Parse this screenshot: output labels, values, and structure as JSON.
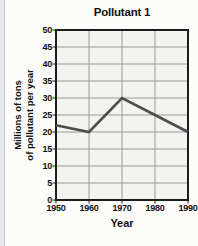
{
  "page": {
    "background": "#fcfcfa",
    "left_strip_color": "#e4e7ee",
    "left_strip_border": "#c6cad6"
  },
  "chart_data": {
    "type": "line",
    "title": "Pollutant 1",
    "xlabel": "Year",
    "ylabel": "Millions of tons of pollutant per year",
    "ylabel_lines": [
      "Millions of tons",
      "of pollutant per year"
    ],
    "categories": [
      "1950",
      "1960",
      "1970",
      "1980",
      "1990"
    ],
    "values": [
      22,
      20,
      30,
      25,
      20
    ],
    "ylim": [
      0,
      50
    ],
    "yticks": [
      0,
      5,
      10,
      15,
      20,
      25,
      30,
      35,
      40,
      45,
      50
    ],
    "grid": true,
    "legend": "none",
    "line_color": "#4d4d4d",
    "grid_color": "#9a9a9a",
    "axis_color": "#1c1c1c",
    "plot_bg": "#f3f3f0",
    "text_color": "#111111"
  }
}
